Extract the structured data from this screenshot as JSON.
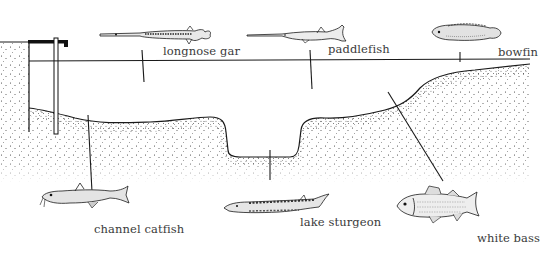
{
  "diagram": {
    "type": "river-cross-section",
    "colors": {
      "ink": "#1a1a1a",
      "text": "#3a3a3a",
      "background": "#ffffff"
    },
    "fish": [
      {
        "name": "longnose gar",
        "zone": "surface",
        "label_x": 163,
        "label_y": 45
      },
      {
        "name": "paddlefish",
        "zone": "mid-water",
        "label_x": 328,
        "label_y": 44
      },
      {
        "name": "bowfin",
        "zone": "surface-shallows",
        "label_x": 498,
        "label_y": 47
      },
      {
        "name": "channel catfish",
        "zone": "bottom",
        "label_x": 94,
        "label_y": 224
      },
      {
        "name": "lake sturgeon",
        "zone": "deep-channel-bottom",
        "label_x": 300,
        "label_y": 217
      },
      {
        "name": "white bass",
        "zone": "slope",
        "label_x": 477,
        "label_y": 233
      }
    ]
  }
}
